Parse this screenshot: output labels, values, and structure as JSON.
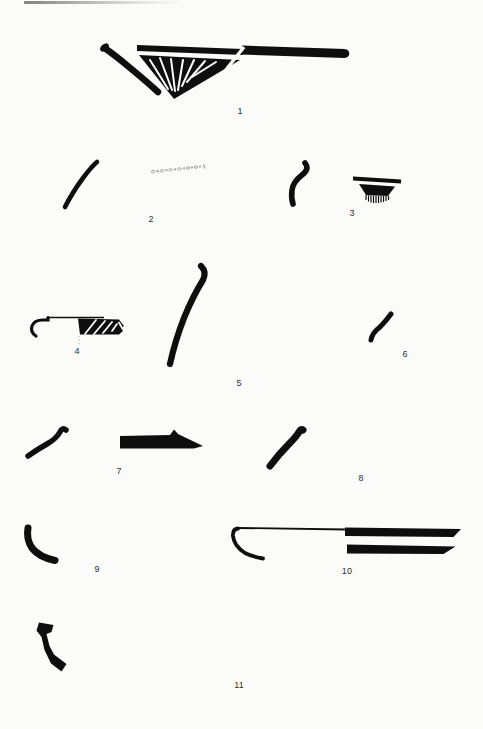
{
  "page": {
    "background": "#fbfbfa",
    "ink_color": "#0e0e0e",
    "label_color": "#2f2f2f",
    "kind": "scanned pottery-sherd figure plate"
  },
  "figure": {
    "items": [
      {
        "label": "1",
        "shape": "carinated rim sherd: hatched solid triangle below horizontal rim band, curved lip profile at left"
      },
      {
        "label": "2",
        "shape": "curved wall profile with faint stamped oval band"
      },
      {
        "label": "3",
        "shape": "s-curved rim profile and rim band with comb fringe"
      },
      {
        "label": "4",
        "shape": "stepped rim profile with hatched lug section and dotted axis"
      },
      {
        "label": "5",
        "shape": "tall everted rim profile"
      },
      {
        "label": "6",
        "shape": "small s-curved rim profile"
      },
      {
        "label": "7",
        "shape": "s-curved rim profile and tapered flat base section"
      },
      {
        "label": "8",
        "shape": "thick everted rim profile"
      },
      {
        "label": "9",
        "shape": "curved base profile"
      },
      {
        "label": "10",
        "shape": "shallow bowl rim profile with two parallel wall bands"
      },
      {
        "label": "11",
        "shape": "thick angled foot profile"
      }
    ]
  }
}
